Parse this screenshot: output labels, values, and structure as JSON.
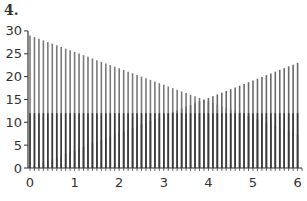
{
  "figure_label": "4.",
  "chart_data": {
    "type": "bar",
    "subtype": "stem",
    "title": "",
    "xlabel": "",
    "ylabel": "",
    "xlim": [
      0,
      6.1
    ],
    "ylim": [
      0,
      30
    ],
    "x_ticks": [
      0,
      1,
      2,
      3,
      4,
      5,
      6
    ],
    "y_ticks": [
      0,
      5,
      10,
      15,
      20,
      25,
      30
    ],
    "x_step": 0.1,
    "series": [
      {
        "name": "decreasing",
        "formula": "29 - 3.6x",
        "start": 29,
        "end": 7.4,
        "color": "#7a7a7a"
      },
      {
        "name": "increasing",
        "formula": "3.83x",
        "start": 0,
        "end": 23,
        "color": "#6a6a6a"
      },
      {
        "name": "constant",
        "formula": "12",
        "start": 12,
        "end": 12,
        "color": "#3a3a3a"
      }
    ],
    "grid": false,
    "legend": "none"
  },
  "layout": {
    "x0_px": 30,
    "px_per_x": 44.6,
    "y0_px": 168,
    "px_per_y": 4.57
  }
}
